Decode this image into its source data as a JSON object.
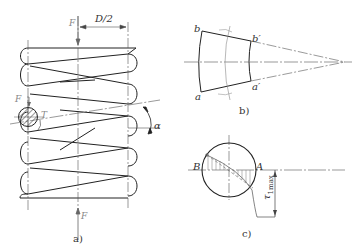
{
  "figure": {
    "panel_a": {
      "caption": "a)",
      "labels": {
        "force_top": "F",
        "half_diameter": "D/2",
        "force_section": "F",
        "torque": "T",
        "helix_angle": "α",
        "force_bottom": "F"
      }
    },
    "panel_b": {
      "caption": "b)",
      "labels": {
        "b": "b",
        "b_prime": "b′",
        "a": "a",
        "a_prime": "a′"
      }
    },
    "panel_c": {
      "caption": "c)",
      "labels": {
        "B": "B",
        "A": "A",
        "tau_max": "τ",
        "tau_max_sub": "1max"
      }
    }
  }
}
